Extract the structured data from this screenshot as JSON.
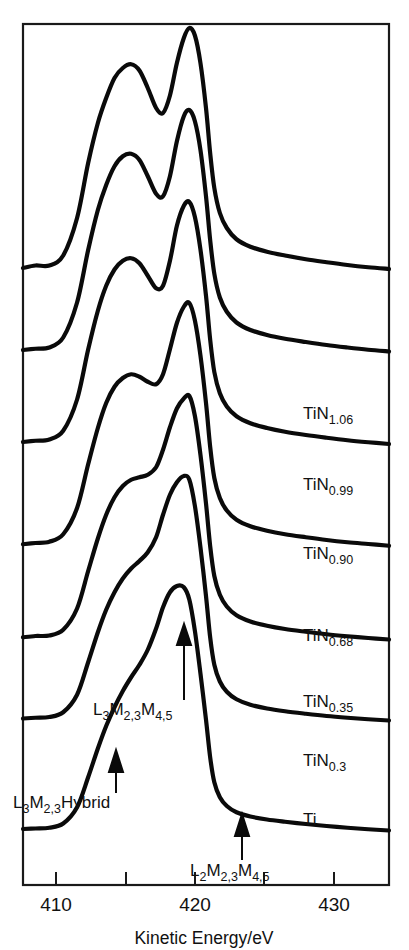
{
  "figure": {
    "kind": "auger-electron-spectra-stack",
    "background_color": "#ffffff",
    "line_color": "#0a0a0a",
    "frame_color": "#1a1a1a"
  },
  "axis": {
    "x_title": "Kinetic Energy/eV",
    "x_tick_labels": [
      "410",
      "420",
      "430"
    ],
    "x_major_values": [
      410,
      420,
      430
    ],
    "x_minor_values": [
      415,
      425
    ],
    "x_range": [
      407.6,
      434.0
    ],
    "y_axis_visible": false,
    "frame": "box"
  },
  "curve_labels": [
    {
      "base": "TiN",
      "sub": "1.06"
    },
    {
      "base": "TiN",
      "sub": "0.99"
    },
    {
      "base": "TiN",
      "sub": "0.90"
    },
    {
      "base": "TiN",
      "sub": "0.68"
    },
    {
      "base": "TiN",
      "sub": "0.35"
    },
    {
      "base": "TiN",
      "sub": "0.3"
    },
    {
      "base": "Ti",
      "sub": ""
    }
  ],
  "annotations": [
    {
      "id": "l3m23m45",
      "parts": [
        {
          "t": "L",
          "sub": false
        },
        {
          "t": "3",
          "sub": true
        },
        {
          "t": "M",
          "sub": false
        },
        {
          "t": "2,3",
          "sub": true
        },
        {
          "t": "M",
          "sub": false
        },
        {
          "t": "4,5",
          "sub": true
        }
      ],
      "plain": "L3M2,3M4,5",
      "arrow": "up"
    },
    {
      "id": "l3m23hybrid",
      "parts": [
        {
          "t": "L",
          "sub": false
        },
        {
          "t": "3",
          "sub": true
        },
        {
          "t": "M",
          "sub": false
        },
        {
          "t": "2,3",
          "sub": true
        },
        {
          "t": "Hybrid",
          "sub": false
        }
      ],
      "plain": "L3M2,3Hybrid",
      "arrow": "up"
    },
    {
      "id": "l2m23m45",
      "parts": [
        {
          "t": "L",
          "sub": false
        },
        {
          "t": "2",
          "sub": true
        },
        {
          "t": "M",
          "sub": false
        },
        {
          "t": "2,3",
          "sub": true
        },
        {
          "t": "M",
          "sub": false
        },
        {
          "t": "4,5",
          "sub": true
        }
      ],
      "plain": "L2M2,3M4,5",
      "arrow": "up"
    }
  ],
  "chart_data": {
    "type": "line",
    "title": "",
    "xlabel": "Kinetic Energy/eV",
    "ylabel": "",
    "xlim": [
      407.6,
      434.0
    ],
    "grid": false,
    "legend_position": "inline-right",
    "stacked_offset": true,
    "annotation_energies": {
      "L3M2,3M4,5": 420.1,
      "L3M2,3Hybrid": 415.6,
      "L2M2,3M4,5": 425.5
    },
    "x": [
      407.6,
      408.5,
      409.5,
      410.5,
      411.5,
      412.3,
      413.0,
      413.6,
      414.2,
      414.8,
      415.4,
      416.0,
      416.6,
      417.2,
      417.7,
      418.2,
      418.7,
      419.2,
      419.6,
      420.0,
      420.4,
      420.8,
      421.1,
      421.4,
      421.8,
      422.3,
      423.0,
      424.0,
      425.2,
      426.5,
      428.0,
      429.5,
      431.0,
      432.5,
      434.0
    ],
    "series": [
      {
        "name": "TiN1.06",
        "baseline_px": 278,
        "values": [
          0.04,
          0.05,
          0.05,
          0.09,
          0.24,
          0.46,
          0.62,
          0.72,
          0.8,
          0.84,
          0.855,
          0.83,
          0.76,
          0.68,
          0.66,
          0.73,
          0.86,
          0.96,
          1.0,
          0.97,
          0.86,
          0.68,
          0.5,
          0.36,
          0.26,
          0.2,
          0.155,
          0.125,
          0.105,
          0.09,
          0.075,
          0.063,
          0.052,
          0.043,
          0.036
        ]
      },
      {
        "name": "TiN0.99",
        "baseline_px": 360,
        "values": [
          0.04,
          0.045,
          0.05,
          0.09,
          0.23,
          0.44,
          0.6,
          0.7,
          0.775,
          0.815,
          0.825,
          0.8,
          0.735,
          0.665,
          0.655,
          0.735,
          0.875,
          0.975,
          1.0,
          0.955,
          0.84,
          0.655,
          0.48,
          0.345,
          0.25,
          0.193,
          0.15,
          0.12,
          0.1,
          0.085,
          0.072,
          0.06,
          0.05,
          0.041,
          0.034
        ]
      },
      {
        "name": "TiN0.90",
        "baseline_px": 452,
        "values": [
          0.04,
          0.045,
          0.05,
          0.085,
          0.21,
          0.41,
          0.565,
          0.665,
          0.73,
          0.765,
          0.775,
          0.755,
          0.705,
          0.655,
          0.665,
          0.765,
          0.905,
          0.985,
          1.0,
          0.94,
          0.81,
          0.625,
          0.45,
          0.32,
          0.235,
          0.182,
          0.143,
          0.115,
          0.096,
          0.081,
          0.068,
          0.057,
          0.047,
          0.039,
          0.032
        ]
      },
      {
        "name": "TiN0.68",
        "baseline_px": 553,
        "values": [
          0.035,
          0.04,
          0.045,
          0.075,
          0.18,
          0.355,
          0.5,
          0.6,
          0.665,
          0.7,
          0.715,
          0.705,
          0.685,
          0.675,
          0.715,
          0.815,
          0.92,
          0.985,
          1.0,
          0.93,
          0.79,
          0.6,
          0.425,
          0.3,
          0.22,
          0.17,
          0.133,
          0.107,
          0.089,
          0.075,
          0.063,
          0.052,
          0.043,
          0.036,
          0.029
        ]
      },
      {
        "name": "TiN0.35",
        "baseline_px": 646,
        "values": [
          0.035,
          0.04,
          0.042,
          0.065,
          0.15,
          0.3,
          0.43,
          0.525,
          0.595,
          0.64,
          0.665,
          0.675,
          0.685,
          0.715,
          0.785,
          0.875,
          0.95,
          0.99,
          1.0,
          0.92,
          0.765,
          0.57,
          0.4,
          0.28,
          0.205,
          0.158,
          0.123,
          0.098,
          0.081,
          0.068,
          0.057,
          0.047,
          0.039,
          0.032,
          0.026
        ]
      },
      {
        "name": "TiN0.3",
        "baseline_px": 726,
        "values": [
          0.03,
          0.033,
          0.036,
          0.055,
          0.125,
          0.255,
          0.375,
          0.465,
          0.535,
          0.59,
          0.63,
          0.66,
          0.695,
          0.755,
          0.845,
          0.925,
          0.975,
          1.0,
          0.985,
          0.88,
          0.715,
          0.52,
          0.355,
          0.245,
          0.178,
          0.137,
          0.107,
          0.085,
          0.07,
          0.059,
          0.049,
          0.04,
          0.033,
          0.027,
          0.022
        ]
      },
      {
        "name": "Ti",
        "baseline_px": 836,
        "values": [
          0.028,
          0.03,
          0.033,
          0.05,
          0.115,
          0.235,
          0.35,
          0.44,
          0.515,
          0.58,
          0.635,
          0.685,
          0.745,
          0.83,
          0.915,
          0.975,
          1.0,
          0.995,
          0.945,
          0.82,
          0.65,
          0.465,
          0.315,
          0.215,
          0.155,
          0.12,
          0.095,
          0.078,
          0.066,
          0.057,
          0.048,
          0.04,
          0.033,
          0.027,
          0.022
        ]
      }
    ]
  }
}
